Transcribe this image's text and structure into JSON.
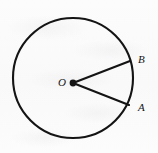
{
  "figure": {
    "kind": "geometry-diagram",
    "background_color": "#fbfbfb",
    "stroke_color": "#141414",
    "circle": {
      "name": "circle",
      "center_x": 73,
      "center_y": 78,
      "radius": 60,
      "stroke_width": 2.1
    },
    "center_point": {
      "name": "center-point-O",
      "x": 73,
      "y": 83,
      "dot_radius": 3.4
    },
    "radii": [
      {
        "name": "radius-OB",
        "from_label": "O",
        "to_label": "B",
        "x1": 73,
        "y1": 83,
        "x2": 130,
        "y2": 61,
        "stroke_width": 2.1
      },
      {
        "name": "radius-OA",
        "from_label": "O",
        "to_label": "A",
        "x1": 73,
        "y1": 83,
        "x2": 129,
        "y2": 105,
        "stroke_width": 2.1
      }
    ],
    "labels": {
      "center": "O",
      "point_upper": "B",
      "point_lower": "A"
    }
  }
}
